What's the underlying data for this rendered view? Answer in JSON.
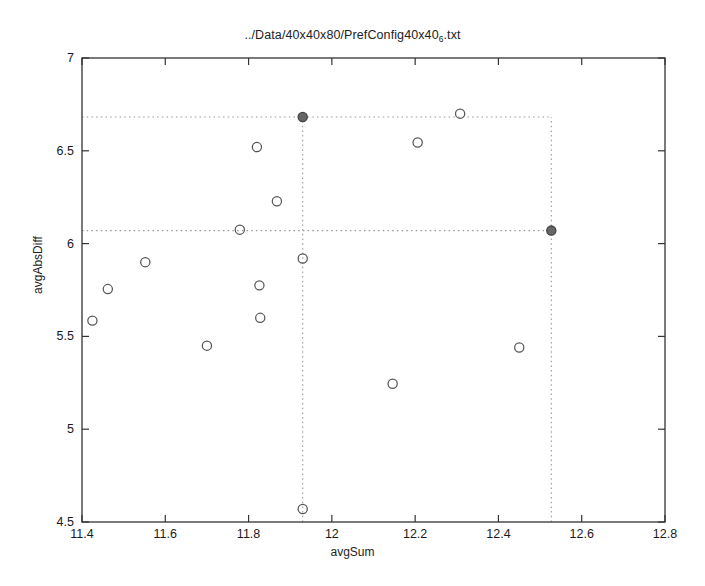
{
  "chart_data": {
    "type": "scatter",
    "title": "../Data/40x40x80/PrefConfig40x40",
    "title_subscript": "6",
    "title_suffix": ".txt",
    "title_full": "../Data/40x40x80/PrefConfig40x40_6.txt",
    "xlabel": "avgSum",
    "ylabel": "avgAbsDiff",
    "xlim": [
      11.4,
      12.8
    ],
    "ylim": [
      4.5,
      7.0
    ],
    "xticks": [
      11.4,
      11.6,
      11.8,
      12.0,
      12.2,
      12.4,
      12.6,
      12.8
    ],
    "xtick_labels": [
      "11.4",
      "11.6",
      "11.8",
      "12",
      "12.2",
      "12.4",
      "12.6",
      "12.8"
    ],
    "yticks": [
      4.5,
      5.0,
      5.5,
      6.0,
      6.5,
      7.0
    ],
    "ytick_labels": [
      "4.5",
      "5",
      "5.5",
      "6",
      "6.5",
      "7"
    ],
    "grid": false,
    "legend": null,
    "marker": "open-circle",
    "marker_color": "#555555",
    "highlight_color": "#666666",
    "guide_line_style": "dotted",
    "guide_line_color": "#999999",
    "points": [
      {
        "x": 11.425,
        "y": 5.585
      },
      {
        "x": 11.462,
        "y": 5.755
      },
      {
        "x": 11.552,
        "y": 5.9
      },
      {
        "x": 11.7,
        "y": 5.45
      },
      {
        "x": 11.779,
        "y": 6.075
      },
      {
        "x": 11.82,
        "y": 6.52
      },
      {
        "x": 11.826,
        "y": 5.775
      },
      {
        "x": 11.828,
        "y": 5.6
      },
      {
        "x": 11.868,
        "y": 6.228
      },
      {
        "x": 11.93,
        "y": 5.92
      },
      {
        "x": 11.93,
        "y": 4.57
      },
      {
        "x": 12.146,
        "y": 5.245
      },
      {
        "x": 12.206,
        "y": 6.545
      },
      {
        "x": 12.308,
        "y": 6.7
      },
      {
        "x": 12.45,
        "y": 5.44
      }
    ],
    "highlight_points": [
      {
        "x": 11.93,
        "y": 6.682,
        "label": "knee-point-upper"
      },
      {
        "x": 12.527,
        "y": 6.07,
        "label": "knee-point-lower"
      }
    ],
    "guide_lines": {
      "horizontal": [
        6.682,
        6.07
      ],
      "vertical": [
        11.93,
        12.527
      ]
    }
  }
}
